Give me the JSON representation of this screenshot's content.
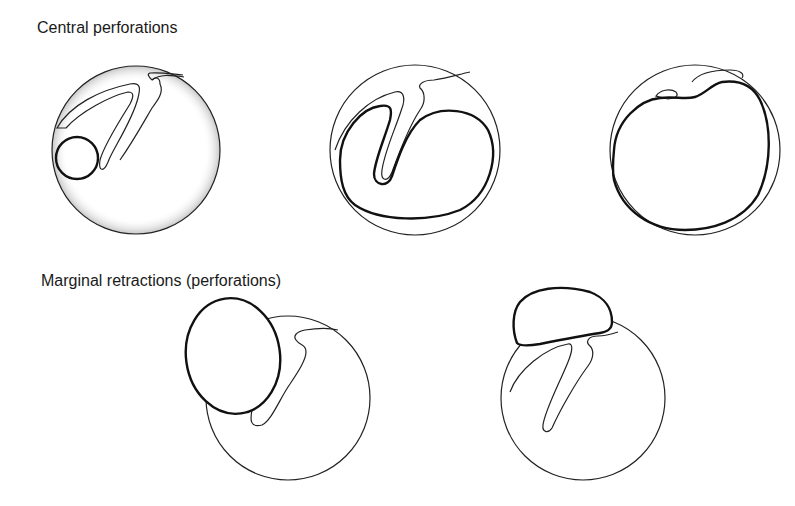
{
  "figure": {
    "sections": [
      {
        "title": "Central perforations",
        "panels": [
          {
            "id": "central-1",
            "description": "small round central perforation at posterosuperior margin of pars tensa, malleus handle visible"
          },
          {
            "id": "central-2",
            "description": "kidney-shaped central perforation surrounding malleus handle"
          },
          {
            "id": "central-3",
            "description": "subtotal central perforation with thin residual rim"
          }
        ]
      },
      {
        "title": "Marginal retractions (perforations)",
        "panels": [
          {
            "id": "marginal-1",
            "description": "posterosuperior marginal retraction extending beyond annulus"
          },
          {
            "id": "marginal-2",
            "description": "attic (pars flaccida) marginal retraction above the drum"
          }
        ]
      }
    ],
    "colors": {
      "line": "#222222",
      "background": "#ffffff",
      "stipple": "#555555"
    }
  }
}
